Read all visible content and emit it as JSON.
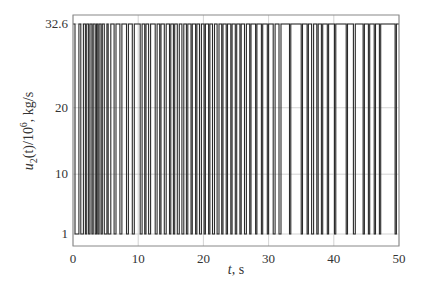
{
  "chart_data": {
    "type": "line",
    "title": "",
    "xlabel": "t, s",
    "ylabel": "u2(t)/10^6, kg/s",
    "xlim": [
      0,
      50
    ],
    "ylim": [
      1,
      32.6
    ],
    "x_ticks": [
      "0",
      "10",
      "20",
      "30",
      "40",
      "50"
    ],
    "y_ticks": [
      "1",
      "10",
      "20",
      "32.6"
    ],
    "grid": true,
    "legend": null,
    "levels": {
      "low": 1,
      "high": 32.6
    },
    "switch_times": [
      0.3,
      0.9,
      1.2,
      1.6,
      1.9,
      2.1,
      2.4,
      2.6,
      2.9,
      3.1,
      3.4,
      3.6,
      3.8,
      4.0,
      4.3,
      4.5,
      4.8,
      5.2,
      5.4,
      5.8,
      6.3,
      6.6,
      7.2,
      7.5,
      8.2,
      8.5,
      9.1,
      9.4,
      10.3,
      10.6,
      11.0,
      11.2,
      11.6,
      11.9,
      12.6,
      12.9,
      13.3,
      13.5,
      14.0,
      14.3,
      14.8,
      15.0,
      15.4,
      15.6,
      16.0,
      16.3,
      16.7,
      17.0,
      17.4,
      17.6,
      18.1,
      18.3,
      18.8,
      19.0,
      19.4,
      19.7,
      20.1,
      20.3,
      20.8,
      21.0,
      21.4,
      21.7,
      22.1,
      22.4,
      22.8,
      23.0,
      23.5,
      23.7,
      24.2,
      24.4,
      24.9,
      25.1,
      25.6,
      25.8,
      26.3,
      26.6,
      27.1,
      27.3,
      28.0,
      28.2,
      28.9,
      29.1,
      29.8,
      30.0,
      30.7,
      31.0,
      31.6,
      31.9,
      33.2,
      33.4,
      35.0,
      35.2,
      35.9,
      36.1,
      36.6,
      36.9,
      37.4,
      37.6,
      38.1,
      38.3,
      39.0,
      39.2,
      40.1,
      40.3,
      41.9,
      42.1,
      43.0,
      43.3,
      44.5,
      44.7,
      45.3,
      45.5,
      46.2,
      46.4,
      47.0,
      47.2,
      49.4,
      49.6
    ]
  },
  "axes": {
    "x_label_italic": "t",
    "x_label_rest": ", s",
    "y_label_main": "u",
    "y_label_sub": "2",
    "y_label_rest": "(t)/10",
    "y_label_sup": "6",
    "y_label_units": ", kg/s"
  },
  "colors": {
    "signal": "#2a2a2a",
    "grid": "#c8c8c8",
    "frame": "#888888"
  }
}
